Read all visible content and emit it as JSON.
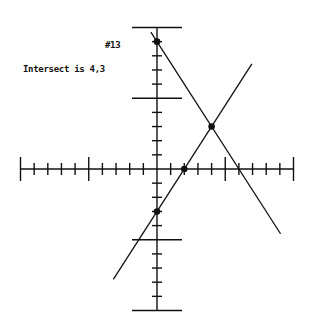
{
  "labels": {
    "problem_number": "#13",
    "intersect_text": "Intersect is 4,3"
  },
  "chart_data": {
    "type": "line",
    "title": "#13",
    "annotation": "Intersect is 4,3",
    "xlabel": "",
    "ylabel": "",
    "xlim": [
      -10,
      10
    ],
    "ylim": [
      -10,
      10
    ],
    "major_tick_interval": 5,
    "minor_tick_interval": 1,
    "grid": false,
    "series": [
      {
        "name": "line-1",
        "equation": "y = -1.5x + 9",
        "points": [
          {
            "x": 0,
            "y": 9
          },
          {
            "x": 4,
            "y": 3
          }
        ]
      },
      {
        "name": "line-2",
        "equation": "y = 1.5x - 3",
        "points": [
          {
            "x": 0,
            "y": -3
          },
          {
            "x": 2,
            "y": 0
          },
          {
            "x": 4,
            "y": 3
          }
        ]
      }
    ],
    "intersection": {
      "x": 4,
      "y": 3
    }
  },
  "colors": {
    "ink": "#111111",
    "background": "#ffffff"
  }
}
